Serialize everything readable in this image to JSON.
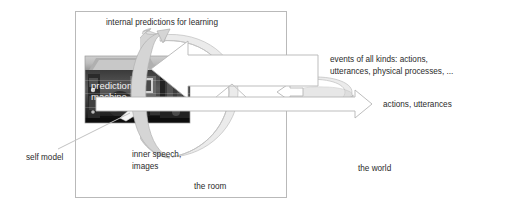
{
  "figure": {
    "title_text": "",
    "labels": {
      "internal_predictions": "internal predictions for learning",
      "events_line1": "events of all kinds: actions,",
      "events_line2": "utterances, physical processes, ...",
      "actions_utterances": "actions, utterances",
      "self_model": "self model",
      "inner_speech_line1": "inner speech,",
      "inner_speech_line2": "images",
      "the_room": "the room",
      "the_world": "the world",
      "machine_line1": "prediction",
      "machine_line2": "machine"
    },
    "icons": {
      "loop_left": "circular-loop-arrow-icon",
      "loop_right": "circular-loop-arrow-icon",
      "arrow_events": "left-block-arrow-icon",
      "arrow_actions": "right-block-arrow-icon",
      "pointer_self_model": "pointer-line-icon",
      "photo": "prediction-machine-photo-icon"
    },
    "colors": {
      "background": "#ffffff",
      "room_border": "#b9b9b9",
      "arrow_fill": "#ffffff",
      "arrow_stroke": "#b5b5b5",
      "ribbon_fill": "#d5d5d5",
      "text": "#2b2b2b",
      "photo_text": "#f2f2f2"
    },
    "geometry": {
      "room_rect": [
        75,
        11,
        211,
        187
      ],
      "photo_rect": [
        85,
        56,
        105,
        67
      ],
      "right_arrow_tip_x": 370,
      "canvas": [
        509,
        207
      ]
    }
  }
}
